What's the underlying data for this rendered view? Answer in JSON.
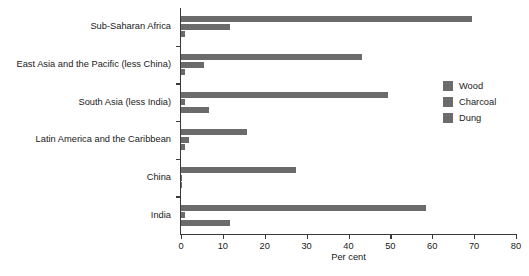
{
  "chart_data": {
    "type": "bar",
    "orientation": "horizontal",
    "title": "",
    "xlabel": "Per cent",
    "ylabel": "",
    "xlim": [
      0,
      80
    ],
    "xticks": [
      0,
      10,
      20,
      30,
      40,
      50,
      60,
      70,
      80
    ],
    "grid": false,
    "legend_position": "right",
    "categories": [
      "Sub-Saharan Africa",
      "East Asia and the Pacific (less China)",
      "South Asia (less India)",
      "Latin America and the Caribbean",
      "China",
      "India"
    ],
    "series": [
      {
        "name": "Wood",
        "color": "#6b6b6b",
        "values": [
          69.4,
          43.2,
          49.4,
          15.8,
          27.4,
          58.5
        ]
      },
      {
        "name": "Charcoal",
        "color": "#6b6b6b",
        "values": [
          11.7,
          5.5,
          1.0,
          2.0,
          0.2,
          1.0
        ]
      },
      {
        "name": "Dung",
        "color": "#6b6b6b",
        "values": [
          1.0,
          1.0,
          6.7,
          1.0,
          0.2,
          11.7
        ]
      }
    ]
  },
  "legend": {
    "items": [
      {
        "label": "Wood"
      },
      {
        "label": "Charcoal"
      },
      {
        "label": "Dung"
      }
    ]
  }
}
